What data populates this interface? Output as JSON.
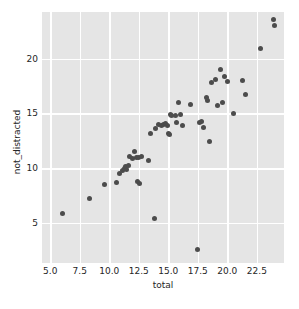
{
  "chart_data": {
    "type": "scatter",
    "title": "",
    "xlabel": "total",
    "ylabel": "not_distracted",
    "xlim": [
      4.3,
      24.8
    ],
    "ylim": [
      1.3,
      24.3
    ],
    "grid": true,
    "legend": null,
    "xticks": [
      5.0,
      7.5,
      10.0,
      12.5,
      15.0,
      17.5,
      20.0,
      22.5
    ],
    "xtick_labels": [
      "5.0",
      "7.5",
      "10.0",
      "12.5",
      "15.0",
      "17.5",
      "20.0",
      "22.5"
    ],
    "yticks": [
      5,
      10,
      15,
      20
    ],
    "ytick_labels": [
      "5",
      "10",
      "15",
      "20"
    ],
    "marker_color": "#4c4c4c",
    "background_color": "#e5e5e5",
    "grid_color": "#ffffff",
    "x": [
      6.0,
      8.3,
      9.6,
      10.6,
      10.9,
      11.1,
      11.3,
      11.4,
      11.5,
      11.6,
      11.7,
      12.0,
      12.1,
      12.3,
      12.4,
      12.5,
      12.6,
      12.7,
      13.3,
      13.5,
      13.8,
      13.9,
      14.2,
      14.4,
      14.6,
      14.8,
      14.9,
      15.0,
      15.1,
      15.2,
      15.3,
      15.6,
      15.7,
      15.9,
      16.0,
      16.2,
      16.9,
      17.5,
      17.6,
      17.8,
      18.0,
      18.2,
      18.3,
      18.5,
      18.7,
      19.0,
      19.2,
      19.4,
      19.6,
      19.8,
      20.0,
      20.5,
      21.3,
      21.5,
      22.8,
      23.9,
      24.0
    ],
    "y": [
      5.8,
      7.2,
      8.5,
      8.7,
      9.5,
      9.8,
      10.0,
      10.1,
      9.9,
      10.2,
      11.1,
      10.9,
      11.5,
      11.0,
      8.8,
      11.0,
      8.6,
      11.1,
      10.7,
      13.2,
      5.4,
      13.6,
      14.0,
      13.9,
      14.0,
      14.1,
      13.9,
      13.2,
      13.1,
      14.9,
      14.8,
      14.8,
      14.2,
      16.0,
      14.9,
      13.9,
      15.8,
      2.5,
      14.2,
      14.3,
      13.7,
      16.5,
      16.2,
      12.4,
      17.8,
      18.1,
      15.7,
      19.0,
      16.0,
      18.4,
      17.9,
      15.0,
      18.0,
      16.7,
      21.0,
      23.6,
      23.1
    ],
    "n_points": 57
  },
  "axes": {
    "x_axis_label": "total",
    "y_axis_label": "not_distracted"
  }
}
